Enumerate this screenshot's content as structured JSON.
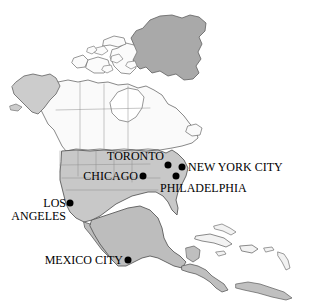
{
  "map": {
    "title": "North America city map",
    "background_color": "#ffffff",
    "outline_color": "#555555",
    "regions": [
      {
        "name": "Greenland",
        "fill": "#a9a9a9"
      },
      {
        "name": "Canada",
        "fill": "#fafafa"
      },
      {
        "name": "Arctic Archipelago",
        "fill": "#fbfbfb"
      },
      {
        "name": "Alaska",
        "fill": "#cccccc"
      },
      {
        "name": "United States",
        "fill": "#c8c8c8"
      },
      {
        "name": "Mexico",
        "fill": "#bdbdbd"
      },
      {
        "name": "Central America",
        "fill": "#bfbfbf"
      },
      {
        "name": "Caribbean Islands",
        "fill": "#f2f2f2"
      },
      {
        "name": "South America (northern tip)",
        "fill": "#c0c0c0"
      }
    ],
    "marker_color": "#000000",
    "marker_radius_px": 3.5
  },
  "cities": [
    {
      "id": "toronto",
      "name": "TORONTO",
      "dot_x": 168,
      "dot_y": 165,
      "label_x": 164,
      "label_y": 156,
      "label_align": "left",
      "lines": [
        "TORONTO"
      ]
    },
    {
      "id": "new-york-city",
      "name": "NEW YORK CITY",
      "dot_x": 182,
      "dot_y": 167,
      "label_x": 188,
      "label_y": 167,
      "label_align": "right",
      "lines": [
        "NEW YORK CITY"
      ]
    },
    {
      "id": "chicago",
      "name": "CHICAGO",
      "dot_x": 143,
      "dot_y": 176,
      "label_x": 138,
      "label_y": 176,
      "label_align": "left",
      "lines": [
        "CHICAGO"
      ]
    },
    {
      "id": "philadelphia",
      "name": "PHILADELPHIA",
      "dot_x": 176,
      "dot_y": 176,
      "label_x": 160,
      "label_y": 188,
      "label_align": "right",
      "lines": [
        "PHILADELPHIA"
      ]
    },
    {
      "id": "los-angeles",
      "name": "LOS ANGELES",
      "dot_x": 70,
      "dot_y": 203,
      "label_x": 66,
      "label_y": 209,
      "label_align": "left",
      "lines": [
        "LOS",
        "ANGELES"
      ]
    },
    {
      "id": "mexico-city",
      "name": "MEXICO CITY",
      "dot_x": 128,
      "dot_y": 260,
      "label_x": 123,
      "label_y": 260,
      "label_align": "left",
      "lines": [
        "MEXICO CITY"
      ]
    }
  ]
}
